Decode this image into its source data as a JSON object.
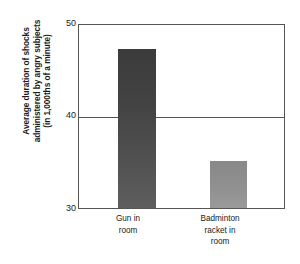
{
  "chart_data": {
    "type": "bar",
    "title": "",
    "subtitle": "",
    "xlabel": "",
    "ylabel": "Average duration of shocks administered by angry subjects (in 1,000ths of a minute)",
    "ylabel_lines": [
      "Average duration of shocks",
      "administered by angry subjects",
      "(in 1,000ths of a minute)"
    ],
    "categories": [
      "Gun in room",
      "Badminton racket in room"
    ],
    "category_lines": [
      [
        "Gun in",
        "room"
      ],
      [
        "Badminton",
        "racket in",
        "room"
      ]
    ],
    "values": [
      47.4,
      35.1
    ],
    "ylim": [
      30,
      50
    ],
    "yticks": [
      30,
      40,
      50
    ],
    "ytick_labels": [
      "30",
      "40",
      "50"
    ],
    "grid": "horizontal-at-40",
    "gridlines": [
      40
    ],
    "legend": "none",
    "bar_colors": [
      "#434343",
      "#8e8e8e"
    ],
    "axis_color": "#555555",
    "background": "#ffffff"
  }
}
